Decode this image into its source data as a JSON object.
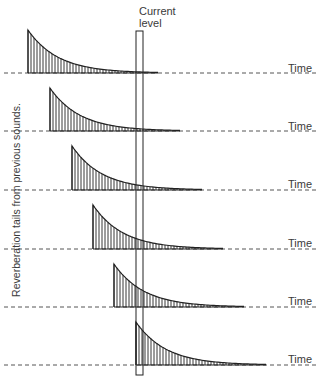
{
  "title_label": {
    "line1": "Current",
    "line2": "level"
  },
  "side_label": "Reverberation tails from previous sounds.",
  "axis_label": "Time",
  "colors": {
    "stroke": "#222222",
    "dashed": "#555555",
    "text": "#3a3a3a",
    "background": "#ffffff"
  },
  "current_level_box": {
    "x": 136,
    "y": 31,
    "width": 7,
    "height": 344
  },
  "rows": [
    {
      "index": 1,
      "start_x": 28,
      "peak_y": 30,
      "baseline_y": 73,
      "time_label": "Time",
      "time_label_y": 62
    },
    {
      "index": 2,
      "start_x": 50,
      "peak_y": 88,
      "baseline_y": 131,
      "time_label": "Time",
      "time_label_y": 120
    },
    {
      "index": 3,
      "start_x": 72,
      "peak_y": 146,
      "baseline_y": 190,
      "time_label": "Time",
      "time_label_y": 178
    },
    {
      "index": 4,
      "start_x": 93,
      "peak_y": 205,
      "baseline_y": 249,
      "time_label": "Time",
      "time_label_y": 237
    },
    {
      "index": 5,
      "start_x": 114,
      "peak_y": 264,
      "baseline_y": 307,
      "time_label": "Time",
      "time_label_y": 295
    },
    {
      "index": 6,
      "start_x": 136,
      "peak_y": 322,
      "baseline_y": 365,
      "time_label": "Time",
      "time_label_y": 353
    }
  ]
}
